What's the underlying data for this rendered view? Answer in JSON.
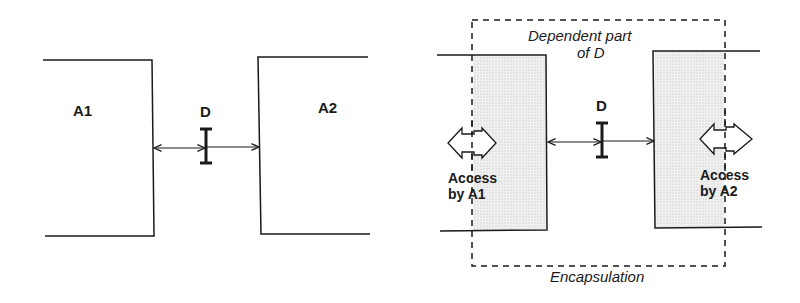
{
  "left_diagram": {
    "box_a1_label": "A1",
    "box_a2_label": "A2",
    "dependency_label": "D"
  },
  "right_diagram": {
    "dependent_part_label_line1": "Dependent part",
    "dependent_part_label_line2": "of D",
    "dependency_label": "D",
    "access_a1_line1": "Access",
    "access_a1_line2": "by A1",
    "access_a2_line1": "Access",
    "access_a2_line2": "by A2",
    "encapsulation_label": "Encapsulation"
  },
  "colors": {
    "line": "#1a1a1a",
    "shade": "#e8e8e8"
  }
}
